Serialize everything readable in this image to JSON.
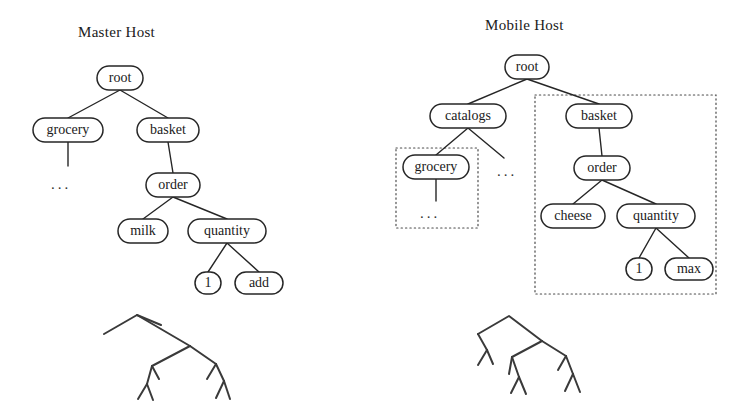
{
  "figure": {
    "width": 748,
    "height": 406,
    "background": "#ffffff",
    "stroke_color": "#262626",
    "dotted_color": "#4a4a4a"
  },
  "panels": [
    {
      "id": "master-host",
      "title": "Master Host",
      "title_x": 78,
      "title_y": 24
    },
    {
      "id": "mobile-host",
      "title": "Mobile Host",
      "title_x": 485,
      "title_y": 17
    }
  ],
  "master_tree": {
    "nodes": [
      {
        "id": "root",
        "label": "root",
        "cx": 120,
        "cy": 78,
        "rx": 23,
        "ry": 12
      },
      {
        "id": "grocery",
        "label": "grocery",
        "cx": 68,
        "cy": 130,
        "rx": 35,
        "ry": 12
      },
      {
        "id": "basket",
        "label": "basket",
        "cx": 168,
        "cy": 130,
        "rx": 31,
        "ry": 12
      },
      {
        "id": "order",
        "label": "order",
        "cx": 173,
        "cy": 185,
        "rx": 27,
        "ry": 12
      },
      {
        "id": "milk",
        "label": "milk",
        "cx": 143,
        "cy": 231,
        "rx": 25,
        "ry": 12
      },
      {
        "id": "quantity",
        "label": "quantity",
        "cx": 227,
        "cy": 231,
        "rx": 39,
        "ry": 12
      },
      {
        "id": "one",
        "label": "1",
        "cx": 208,
        "cy": 283,
        "rx": 13,
        "ry": 11
      },
      {
        "id": "add",
        "label": "add",
        "cx": 259,
        "cy": 283,
        "rx": 24,
        "ry": 11
      }
    ],
    "edges": [
      {
        "from": "root",
        "to": "grocery"
      },
      {
        "from": "root",
        "to": "basket"
      },
      {
        "from": "grocery",
        "to": "ellipsis"
      },
      {
        "from": "basket",
        "to": "order"
      },
      {
        "from": "order",
        "to": "milk"
      },
      {
        "from": "order",
        "to": "quantity"
      },
      {
        "from": "quantity",
        "to": "one"
      },
      {
        "from": "quantity",
        "to": "add"
      }
    ],
    "ellipsis": [
      {
        "id": "grocery-children",
        "label": "...",
        "x": 51,
        "y": 176
      }
    ]
  },
  "mobile_tree": {
    "nodes": [
      {
        "id": "root",
        "label": "root",
        "cx": 527,
        "cy": 67,
        "rx": 22,
        "ry": 12
      },
      {
        "id": "catalogs",
        "label": "catalogs",
        "cx": 468,
        "cy": 116,
        "rx": 38,
        "ry": 12
      },
      {
        "id": "basket",
        "label": "basket",
        "cx": 599,
        "cy": 116,
        "rx": 33,
        "ry": 12
      },
      {
        "id": "grocery",
        "label": "grocery",
        "cx": 436,
        "cy": 167,
        "rx": 33,
        "ry": 12
      },
      {
        "id": "order",
        "label": "order",
        "cx": 602,
        "cy": 168,
        "rx": 28,
        "ry": 12
      },
      {
        "id": "cheese",
        "label": "cheese",
        "cx": 573,
        "cy": 216,
        "rx": 32,
        "ry": 12
      },
      {
        "id": "quantity",
        "label": "quantity",
        "cx": 656,
        "cy": 216,
        "rx": 39,
        "ry": 12
      },
      {
        "id": "one",
        "label": "1",
        "cx": 639,
        "cy": 269,
        "rx": 13,
        "ry": 11
      },
      {
        "id": "max",
        "label": "max",
        "cx": 689,
        "cy": 269,
        "rx": 24,
        "ry": 11
      }
    ],
    "edges": [
      {
        "from": "root",
        "to": "catalogs"
      },
      {
        "from": "root",
        "to": "basket"
      },
      {
        "from": "catalogs",
        "to": "grocery"
      },
      {
        "from": "catalogs",
        "to": "ellipsis"
      },
      {
        "from": "grocery",
        "to": "ellipsis"
      },
      {
        "from": "basket",
        "to": "order"
      },
      {
        "from": "order",
        "to": "cheese"
      },
      {
        "from": "order",
        "to": "quantity"
      },
      {
        "from": "quantity",
        "to": "one"
      },
      {
        "from": "quantity",
        "to": "max"
      }
    ],
    "ellipsis": [
      {
        "id": "catalogs-more",
        "label": "...",
        "x": 497,
        "y": 163
      },
      {
        "id": "grocery-children",
        "label": "...",
        "x": 420,
        "y": 205
      }
    ],
    "dotted_regions": [
      {
        "id": "grocery-region",
        "x": 396,
        "y": 148,
        "width": 82,
        "height": 80
      },
      {
        "id": "basket-region",
        "x": 535,
        "y": 95,
        "width": 181,
        "height": 199
      }
    ]
  },
  "sketches": [
    {
      "id": "master-sketch",
      "caption": "abstract-tree-sketch",
      "polylines": [
        "104,334 137,315 161,325",
        "137,315 190,346",
        "190,346 152,366 147,384",
        "152,366 159,379",
        "147,384 153,400",
        "147,384 138,399",
        "190,346 216,364",
        "216,364 207,379",
        "216,364 224,381",
        "224,381 230,399",
        "224,381 216,398"
      ]
    },
    {
      "id": "mobile-sketch",
      "caption": "abstract-tree-sketch",
      "polylines": [
        "478,334 509,316 542,341",
        "478,334 487,350",
        "487,350 493,364",
        "487,350 478,365",
        "542,341 512,357",
        "512,357 509,374",
        "512,357 519,377",
        "519,377 526,394",
        "519,377 511,393",
        "542,341 566,356",
        "566,356 558,370",
        "566,356 573,374",
        "573,374 580,392",
        "573,374 565,391"
      ]
    }
  ]
}
